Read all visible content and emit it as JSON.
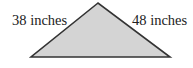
{
  "diagram": {
    "shape": "triangle",
    "fill_color": "#d4d4d4",
    "stroke_color": "#333333",
    "vertices": {
      "apex": [
        98,
        3
      ],
      "left": [
        31,
        57
      ],
      "right": [
        170,
        57
      ]
    },
    "labels": {
      "left_side": "38 inches",
      "right_side": "48 inches"
    }
  }
}
